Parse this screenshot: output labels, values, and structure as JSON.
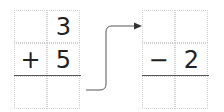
{
  "left_problem": {
    "rows": [
      [
        "",
        "3"
      ],
      [
        "+",
        "5"
      ],
      [
        "",
        ""
      ]
    ]
  },
  "right_problem": {
    "rows": [
      [
        "",
        ""
      ],
      [
        "−",
        "2"
      ],
      [
        "",
        ""
      ]
    ]
  },
  "connector": {
    "icon": "arrow-right-icon",
    "color": "#555555"
  }
}
